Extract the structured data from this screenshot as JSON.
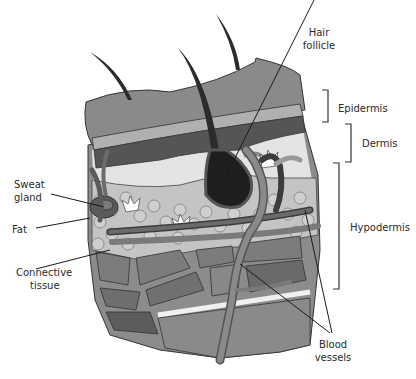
{
  "diagram": {
    "type": "anatomical-cross-section",
    "labels": {
      "hair_follicle": [
        "Hair",
        "follicle"
      ],
      "epidermis": "Epidermis",
      "dermis": "Dermis",
      "hypodermis": "Hypodermis",
      "sweat_gland": [
        "Sweat",
        "gland"
      ],
      "fat": "Fat",
      "connective_tissue": [
        "Connective",
        "tissue"
      ],
      "blood_vessels": [
        "Blood",
        "vessels"
      ]
    },
    "colors": {
      "epidermis_top": "#8a8a8a",
      "epidermis_band_light": "#b0b0b0",
      "epidermis_band_dark": "#555555",
      "dermis": "#e4e4e4",
      "fat_cells": "#c4c4c4",
      "follicle": "#1e1e1e",
      "vessel": "#7a7a7a",
      "vessel_dark": "#3c3c3c",
      "muscle": "#7c7c7c",
      "connective": "#efefef",
      "line": "#222222"
    }
  }
}
